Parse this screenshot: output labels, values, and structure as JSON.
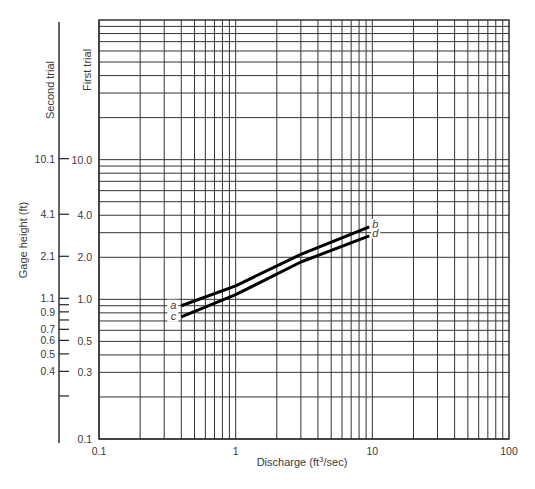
{
  "chart_data": {
    "type": "line",
    "title": "",
    "xlabel": "Discharge (ft³/sec)",
    "xlabel_main": "Discharge (ft",
    "xlabel_sup": "3",
    "xlabel_tail": "/sec)",
    "ylabel": "Gage height (ft)",
    "xscale": "log",
    "yscale": "log",
    "xlim": [
      0.1,
      100
    ],
    "ylim": [
      0.1,
      100
    ],
    "grid": true,
    "x_tick_labels": [
      "0.1",
      "1",
      "10",
      "100"
    ],
    "x_ticks": [
      0.1,
      1,
      10,
      100
    ],
    "first_trial_axis": {
      "label": "First trial",
      "tick_labels": [
        "10.0",
        "4.0",
        "2.0",
        "1.0",
        "0.5",
        "0.3",
        "0.1"
      ],
      "ticks": [
        10,
        4,
        2,
        1,
        0.5,
        0.3,
        0.1
      ]
    },
    "second_trial_axis": {
      "label": "Second trial",
      "tick_labels": [
        "10.1",
        "4.1",
        "2.1",
        "1.1",
        "",
        "0.9",
        "",
        "0.7",
        "0.6",
        "0.5",
        "0.4",
        ""
      ],
      "ticks_first_trial_equiv": [
        10,
        4,
        2,
        1,
        0.9,
        0.8,
        0.7,
        0.6,
        0.5,
        0.4,
        0.3,
        0.2
      ]
    },
    "series": [
      {
        "name": "a-b",
        "start_label": "a",
        "end_label": "b",
        "points": [
          [
            0.4,
            0.9
          ],
          [
            1.0,
            1.25
          ],
          [
            3.0,
            2.1
          ],
          [
            9.5,
            3.3
          ]
        ]
      },
      {
        "name": "c-d",
        "start_label": "c",
        "end_label": "d",
        "points": [
          [
            0.4,
            0.75
          ],
          [
            1.0,
            1.08
          ],
          [
            3.0,
            1.85
          ],
          [
            9.5,
            2.85
          ]
        ]
      }
    ]
  }
}
